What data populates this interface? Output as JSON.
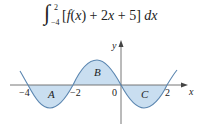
{
  "formula": {
    "integral_sign": "∫",
    "upper_limit": "2",
    "lower_limit": "−4",
    "integrand_parts": [
      "[",
      "f",
      "(",
      "x",
      ") + 2",
      "x",
      " + 5] ",
      "dx"
    ],
    "integrand_text": "[f(x) + 2x + 5] dx"
  },
  "graph": {
    "x_axis_label": "x",
    "y_axis_label": "y",
    "tick_labels": [
      "−4",
      "−2",
      "0",
      "2"
    ],
    "region_labels": [
      "A",
      "B",
      "C"
    ],
    "colors": {
      "curve": "#5b86b0",
      "fill": "#c9def0",
      "axis": "#555555",
      "text": "#222222"
    }
  }
}
